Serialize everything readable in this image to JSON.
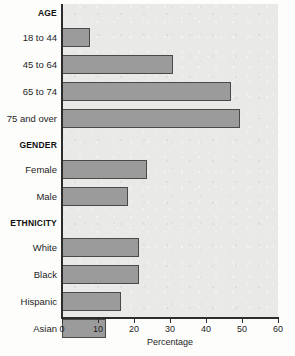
{
  "chart_data": {
    "type": "bar",
    "orientation": "horizontal",
    "title": "",
    "xlabel": "Percentage",
    "ylabel": "",
    "xlim": [
      0,
      60
    ],
    "xticks": [
      0,
      10,
      20,
      30,
      40,
      50,
      60
    ],
    "grid": false,
    "legend": null,
    "bar_color": "#9b9b9b",
    "bar_edge_color": "#4a4a4a",
    "plot_background": "#e9e9e7",
    "groups": [
      {
        "header": "AGE",
        "categories": [
          "18 to 44",
          "45 to 64",
          "65 to 74",
          "75 and over"
        ],
        "values": [
          7.8,
          30.7,
          47.0,
          49.5
        ]
      },
      {
        "header": "GENDER",
        "categories": [
          "Female",
          "Male"
        ],
        "values": [
          23.5,
          18.2
        ]
      },
      {
        "header": "ETHNICITY",
        "categories": [
          "White",
          "Black",
          "Hispanic",
          "Asian"
        ],
        "values": [
          21.5,
          21.5,
          16.3,
          12.3
        ]
      }
    ]
  }
}
